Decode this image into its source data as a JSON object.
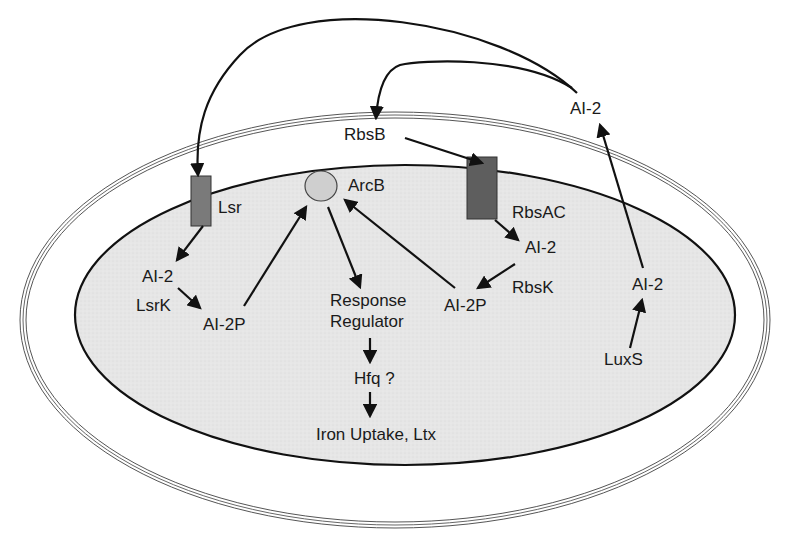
{
  "diagram": {
    "type": "bacterial-cell-signaling-pathway",
    "compartments": {
      "outer_membrane": "outer membrane (double line)",
      "inner_cytoplasm": "cytoplasm (shaded)"
    },
    "colors": {
      "cytoplasm_fill": "#e6e6e6",
      "membrane_stroke": "#444444",
      "lsr_fill": "#7a7a7a",
      "rbsac_fill": "#5e5e5e",
      "arcb_fill": "#cfcfcf",
      "arrow": "#111111"
    },
    "labels": {
      "ai2_external": "AI-2",
      "rbsb": "RbsB",
      "lsr": "Lsr",
      "arcb": "ArcB",
      "rbsac": "RbsAC",
      "ai2_rbs": "AI-2",
      "rbsk": "RbsK",
      "ai2p_rbs": "AI-2P",
      "ai2_lsr": "AI-2",
      "lsrk": "LsrK",
      "ai2p_lsr": "AI-2P",
      "response_regulator_line1": "Response",
      "response_regulator_line2": "Regulator",
      "hfq": "Hfq ?",
      "iron_uptake": "Iron Uptake, Ltx",
      "ai2_luxs": "AI-2",
      "luxs": "LuxS"
    },
    "edges": [
      {
        "from": "AI-2 (external)",
        "to": "Lsr"
      },
      {
        "from": "AI-2 (external)",
        "to": "RbsB"
      },
      {
        "from": "RbsB",
        "to": "RbsAC"
      },
      {
        "from": "RbsAC",
        "to": "AI-2 (RbsAC)"
      },
      {
        "from": "AI-2 (RbsAC)",
        "to": "AI-2P (RbsK)",
        "via": "RbsK"
      },
      {
        "from": "AI-2P (RbsK)",
        "to": "ArcB"
      },
      {
        "from": "Lsr",
        "to": "AI-2 (Lsr)"
      },
      {
        "from": "AI-2 (Lsr)",
        "to": "AI-2P (LsrK)",
        "via": "LsrK"
      },
      {
        "from": "AI-2P (LsrK)",
        "to": "ArcB"
      },
      {
        "from": "ArcB",
        "to": "Response Regulator"
      },
      {
        "from": "Response Regulator",
        "to": "Hfq ?"
      },
      {
        "from": "Hfq ?",
        "to": "Iron Uptake, Ltx"
      },
      {
        "from": "LuxS",
        "to": "AI-2 (LuxS)"
      },
      {
        "from": "AI-2 (LuxS)",
        "to": "AI-2 (external)"
      }
    ]
  }
}
